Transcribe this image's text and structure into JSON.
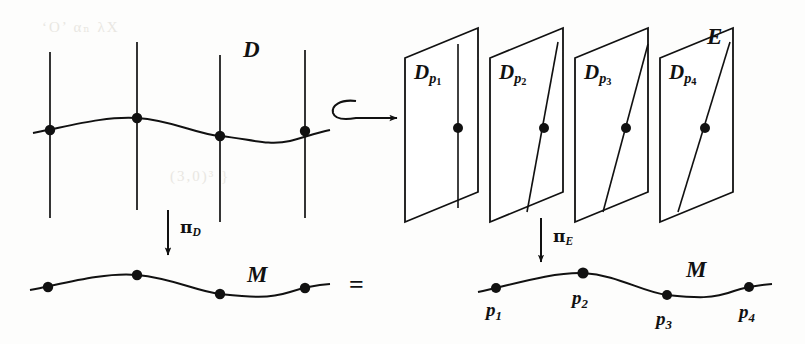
{
  "figure": {
    "caption_absent": true,
    "background_color": "#fdfdfc",
    "ink_color": "#111111",
    "labels": {
      "total_space_left": "D",
      "base_space_left": "M",
      "total_space_right": "E",
      "base_space_right": "M",
      "projection_left": "π",
      "projection_left_sub": "D",
      "projection_right": "π",
      "projection_right_sub": "E",
      "equals": "="
    },
    "left_diagram": {
      "name": "fiber-bundle-D",
      "space_label": "D",
      "base_label": "M",
      "fiber_count": 4,
      "fibers": [
        {
          "index": 1,
          "x": 50,
          "top_y": 52,
          "bottom_y": 218,
          "dot_y": 130
        },
        {
          "index": 2,
          "x": 137,
          "top_y": 42,
          "bottom_y": 210,
          "dot_y": 118
        },
        {
          "index": 3,
          "x": 220,
          "top_y": 55,
          "bottom_y": 222,
          "dot_y": 136
        },
        {
          "index": 4,
          "x": 305,
          "top_y": 50,
          "bottom_y": 218,
          "dot_y": 131
        }
      ],
      "section_points": [
        [
          50,
          130
        ],
        [
          137,
          118
        ],
        [
          220,
          136
        ],
        [
          305,
          131
        ]
      ],
      "base_points": [
        [
          48,
          287
        ],
        [
          137,
          275
        ],
        [
          220,
          294
        ],
        [
          305,
          288
        ]
      ]
    },
    "hook_arrow": {
      "name": "inclusion-arrow",
      "glyph": "↪",
      "x_start": 330,
      "x_end": 400,
      "y": 112
    },
    "right_diagram": {
      "name": "fiber-bundle-E",
      "space_label": "E",
      "base_label": "M",
      "planes": [
        {
          "label_base": "D",
          "label_sub": "p",
          "label_index": "1",
          "fiber_slope_desc": "vertical"
        },
        {
          "label_base": "D",
          "label_sub": "p",
          "label_index": "2",
          "fiber_slope_desc": "slightly-tilted"
        },
        {
          "label_base": "D",
          "label_sub": "p",
          "label_index": "3",
          "fiber_slope_desc": "tilted"
        },
        {
          "label_base": "D",
          "label_sub": "p",
          "label_index": "4",
          "fiber_slope_desc": "strongly-tilted"
        }
      ],
      "base_points": [
        {
          "label_base": "p",
          "label_index": "1",
          "x": 496,
          "y": 288
        },
        {
          "label_base": "p",
          "label_index": "2",
          "x": 583,
          "y": 273
        },
        {
          "label_base": "p",
          "label_index": "3",
          "x": 667,
          "y": 295
        },
        {
          "label_base": "p",
          "label_index": "4",
          "x": 749,
          "y": 287
        }
      ]
    }
  },
  "ghost_text": {
    "line1": "‘O’      αₙ     λX",
    "line2": "(3,0)³      }"
  }
}
